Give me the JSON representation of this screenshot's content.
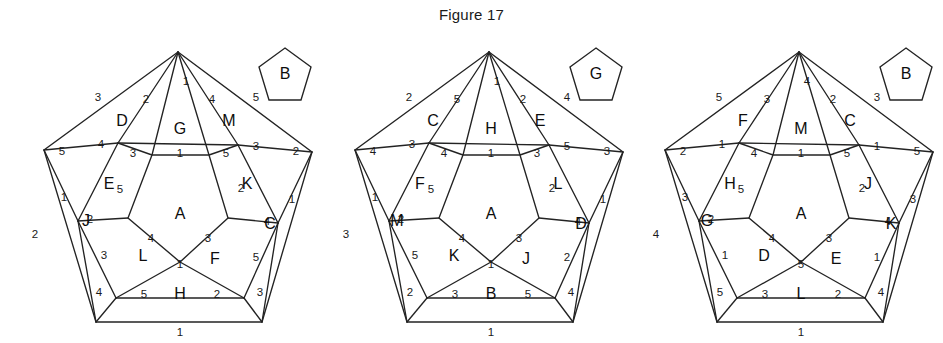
{
  "figure": {
    "title": "Figure 17"
  },
  "chart_data": {
    "type": "diagram",
    "title": "Figure 17",
    "panels": [
      {
        "id": "panel-1",
        "key_pentagon_label": "B",
        "faces": {
          "center": "A",
          "ring_inner": [
            "G",
            "E",
            "L",
            "F",
            "K"
          ],
          "ring_outer": [
            "D",
            "J",
            "H",
            "C",
            "M"
          ]
        },
        "numbers": {
          "apex_center": "1",
          "apex_left": "2",
          "apex_right": "4",
          "outer_upper_left": "3",
          "outer_upper_right": "5",
          "left_corner": "5",
          "right_corner": "2",
          "mid_left": "4",
          "mid_right": "3",
          "inner_top_left": "3",
          "inner_top_center": "1",
          "inner_top_right": "5",
          "inner_left": "5",
          "inner_right": "2",
          "left_spoke": "1",
          "right_spoke": "1",
          "outer_left_edge": "2",
          "outer_right_edge": "4",
          "lower_left_joint": "2",
          "lower_right_joint": "4",
          "lower_left_side": "3",
          "lower_right_side": "5",
          "bottom_left_corner": "4",
          "bottom_right_corner": "3",
          "bottom_left_edge": "5",
          "bottom_right_edge": "2",
          "bowtie_left": "4",
          "bowtie_right": "3",
          "bowtie_center": "1",
          "base": "1"
        }
      },
      {
        "id": "panel-2",
        "key_pentagon_label": "G",
        "faces": {
          "center": "A",
          "ring_inner": [
            "H",
            "F",
            "K",
            "J",
            "L"
          ],
          "ring_outer": [
            "C",
            "M",
            "B",
            "D",
            "E"
          ]
        },
        "numbers": {
          "apex_center": "1",
          "apex_left": "5",
          "apex_right": "2",
          "outer_upper_left": "2",
          "outer_upper_right": "4",
          "left_corner": "4",
          "right_corner": "3",
          "mid_left": "3",
          "mid_right": "5",
          "inner_top_left": "4",
          "inner_top_center": "1",
          "inner_top_right": "3",
          "inner_left": "5",
          "inner_right": "2",
          "left_spoke": "1",
          "right_spoke": "1",
          "outer_left_edge": "3",
          "outer_right_edge": "5",
          "lower_left_joint": "2",
          "lower_right_joint": "4",
          "lower_left_side": "5",
          "lower_right_side": "2",
          "bottom_left_corner": "2",
          "bottom_right_corner": "4",
          "bottom_left_edge": "3",
          "bottom_right_edge": "5",
          "bowtie_left": "4",
          "bowtie_right": "3",
          "bowtie_center": "1",
          "base": "1"
        }
      },
      {
        "id": "panel-3",
        "key_pentagon_label": "B",
        "faces": {
          "center": "A",
          "ring_inner": [
            "M",
            "H",
            "D",
            "E",
            "J"
          ],
          "ring_outer": [
            "F",
            "G",
            "L",
            "K",
            "C"
          ]
        },
        "numbers": {
          "apex_center": "4",
          "apex_left": "3",
          "apex_right": "2",
          "outer_upper_left": "5",
          "outer_upper_right": "3",
          "left_corner": "2",
          "right_corner": "5",
          "mid_left": "1",
          "mid_right": "1",
          "inner_top_left": "4",
          "inner_top_center": "1",
          "inner_top_right": "5",
          "inner_left": "5",
          "inner_right": "2",
          "left_spoke": "3",
          "right_spoke": "3",
          "outer_left_edge": "4",
          "outer_right_edge": "2",
          "lower_left_joint": "2",
          "lower_right_joint": "4",
          "lower_left_side": "1",
          "lower_right_side": "1",
          "bottom_left_corner": "5",
          "bottom_right_corner": "4",
          "bottom_left_edge": "3",
          "bottom_right_edge": "2",
          "bowtie_left": "4",
          "bowtie_right": "3",
          "bowtie_center": "5",
          "base": "1"
        }
      }
    ]
  }
}
